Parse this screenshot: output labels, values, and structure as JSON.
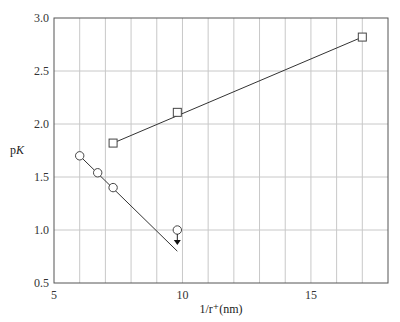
{
  "chart_data": {
    "type": "scatter",
    "title": "",
    "xlabel": "1/r⁺(nm)",
    "ylabel": "pK",
    "xlim": [
      5,
      18
    ],
    "ylim": [
      0.5,
      3.0
    ],
    "x_ticks": [
      5,
      10,
      15
    ],
    "y_ticks": [
      0.5,
      1.0,
      1.5,
      2.0,
      2.5,
      3.0
    ],
    "y_tick_labels": [
      "0.5",
      "1.0",
      "1.5",
      "2.0",
      "2.5",
      "3.0"
    ],
    "x_tick_labels": [
      "5",
      "10",
      "15"
    ],
    "grid": true,
    "legend": null,
    "series": [
      {
        "name": "squares",
        "marker": "square",
        "points": [
          [
            7.3,
            1.82
          ],
          [
            9.8,
            2.11
          ],
          [
            17.0,
            2.82
          ]
        ],
        "fit_line": [
          [
            7.3,
            1.82
          ],
          [
            17.0,
            2.82
          ]
        ]
      },
      {
        "name": "circles",
        "marker": "circle",
        "points": [
          [
            6.0,
            1.7
          ],
          [
            6.7,
            1.54
          ],
          [
            7.3,
            1.4
          ],
          [
            9.8,
            1.0
          ]
        ],
        "fit_line": [
          [
            6.0,
            1.7
          ],
          [
            9.8,
            0.8
          ]
        ],
        "annotations": [
          {
            "type": "down-arrow",
            "at": [
              9.8,
              1.0
            ],
            "meaning": "upper limit"
          }
        ]
      }
    ]
  }
}
